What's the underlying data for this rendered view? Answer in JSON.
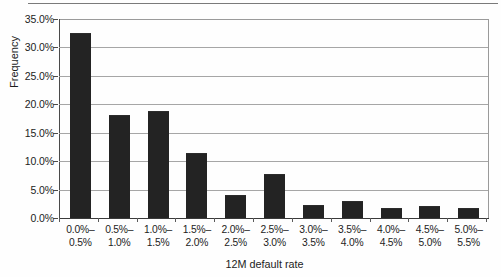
{
  "chart_data": {
    "type": "bar",
    "title": "",
    "xlabel": "12M default rate",
    "ylabel": "Frequency",
    "categories": [
      "0.0%– 0.5%",
      "0.5%– 1.0%",
      "1.0%– 1.5%",
      "1.5%– 2.0%",
      "2.0%– 2.5%",
      "2.5%– 3.0%",
      "3.0%– 3.5%",
      "3.5%– 4.0%",
      "4.0%– 4.5%",
      "4.5%– 5.0%",
      "5.0%– 5.5%"
    ],
    "category_lines": [
      [
        "0.0%–",
        "0.5%"
      ],
      [
        "0.5%–",
        "1.0%"
      ],
      [
        "1.0%–",
        "1.5%"
      ],
      [
        "1.5%–",
        "2.0%"
      ],
      [
        "2.0%–",
        "2.5%"
      ],
      [
        "2.5%–",
        "3.0%"
      ],
      [
        "3.0%–",
        "3.5%"
      ],
      [
        "3.5%–",
        "4.0%"
      ],
      [
        "4.0%–",
        "4.5%"
      ],
      [
        "4.5%–",
        "5.0%"
      ],
      [
        "5.0%–",
        "5.5%"
      ]
    ],
    "values": [
      32.3,
      18.0,
      18.6,
      11.3,
      3.9,
      7.5,
      2.1,
      2.9,
      1.5,
      1.9,
      1.6
    ],
    "value_labels": [
      "32.3%",
      "18.0%",
      "18.6%",
      "11.3%",
      "3.9%",
      "7.5%",
      "2.1%",
      "2.9%",
      "1.5%",
      "1.9%",
      "1.6%"
    ],
    "ylim": [
      0,
      35
    ],
    "yticks": [
      0,
      5,
      10,
      15,
      20,
      25,
      30,
      35
    ],
    "ytick_labels": [
      "0.0%",
      "5.0%",
      "10.0%",
      "15.0%",
      "20.0%",
      "25.0%",
      "30.0%",
      "35.0%"
    ],
    "grid": true,
    "grid_axis": "y",
    "legend": false,
    "bar_color": "#232323",
    "grid_color": "#a6a6a6",
    "axis_color": "#3a3a3a",
    "background": "#fefefe"
  }
}
